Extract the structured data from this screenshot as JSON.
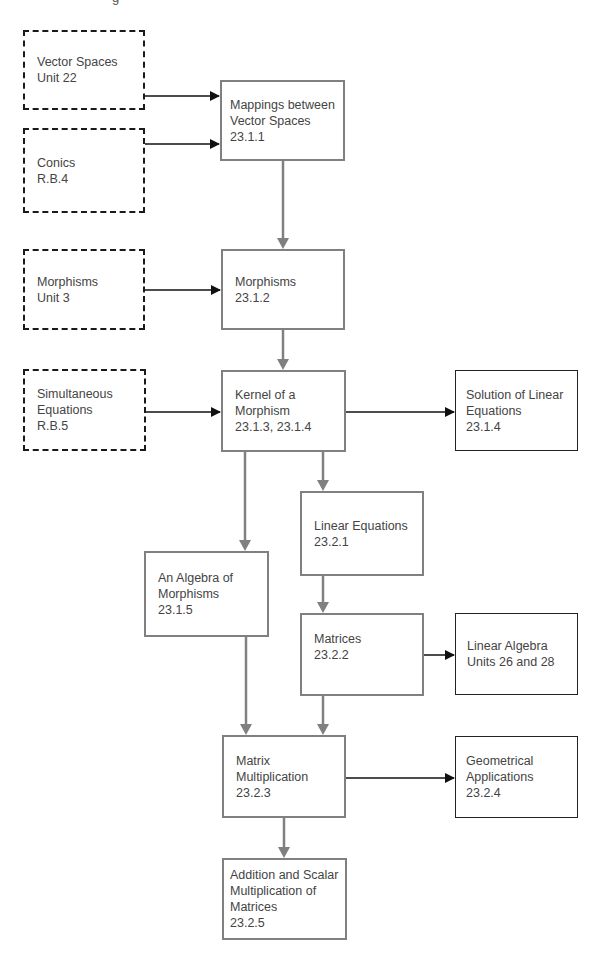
{
  "top_fragment": "g",
  "nodes": {
    "vector_spaces": {
      "lines": [
        "Vector Spaces",
        "Unit 22"
      ],
      "style": "dashed"
    },
    "conics": {
      "lines": [
        "Conics",
        "R.B.4"
      ],
      "style": "dashed"
    },
    "mappings": {
      "lines": [
        "Mappings between",
        "Vector Spaces",
        "23.1.1"
      ],
      "style": "gray"
    },
    "morphisms_unit3": {
      "lines": [
        "Morphisms",
        "Unit 3"
      ],
      "style": "dashed"
    },
    "morphisms": {
      "lines": [
        "Morphisms",
        "23.1.2"
      ],
      "style": "gray"
    },
    "simultaneous": {
      "lines": [
        "Simultaneous",
        "Equations",
        "R.B.5"
      ],
      "style": "dashed"
    },
    "kernel": {
      "lines": [
        "Kernel of a",
        "Morphism",
        "23.1.3, 23.1.4"
      ],
      "style": "gray"
    },
    "solution": {
      "lines": [
        "Solution of Linear",
        "Equations",
        "23.1.4"
      ],
      "style": "thin"
    },
    "linear_equations": {
      "lines": [
        "Linear Equations",
        "23.2.1"
      ],
      "style": "gray"
    },
    "algebra": {
      "lines": [
        "An Algebra of",
        "Morphisms",
        "23.1.5"
      ],
      "style": "gray"
    },
    "matrices": {
      "lines": [
        "Matrices",
        "23.2.2"
      ],
      "style": "gray"
    },
    "linear_algebra": {
      "lines": [
        "Linear Algebra",
        "Units 26 and 28"
      ],
      "style": "thin"
    },
    "matrix_mult": {
      "lines": [
        "Matrix",
        "Multiplication",
        "23.2.3"
      ],
      "style": "gray"
    },
    "geometrical": {
      "lines": [
        "Geometrical",
        "Applications",
        "23.2.4"
      ],
      "style": "thin"
    },
    "addition": {
      "lines": [
        "Addition and Scalar",
        "Multiplication of",
        "Matrices",
        "23.2.5"
      ],
      "style": "gray"
    }
  },
  "edges": [
    {
      "from": "vector_spaces",
      "to": "mappings",
      "kind": "black"
    },
    {
      "from": "conics",
      "to": "mappings",
      "kind": "black"
    },
    {
      "from": "mappings",
      "to": "morphisms",
      "kind": "gray"
    },
    {
      "from": "morphisms_unit3",
      "to": "morphisms",
      "kind": "black"
    },
    {
      "from": "morphisms",
      "to": "kernel",
      "kind": "gray"
    },
    {
      "from": "simultaneous",
      "to": "kernel",
      "kind": "black"
    },
    {
      "from": "kernel",
      "to": "solution",
      "kind": "black"
    },
    {
      "from": "kernel",
      "to": "linear_equations",
      "kind": "gray"
    },
    {
      "from": "kernel",
      "to": "algebra",
      "kind": "gray"
    },
    {
      "from": "linear_equations",
      "to": "matrices",
      "kind": "gray"
    },
    {
      "from": "matrices",
      "to": "linear_algebra",
      "kind": "black"
    },
    {
      "from": "algebra",
      "to": "matrix_mult",
      "kind": "gray"
    },
    {
      "from": "matrices",
      "to": "matrix_mult",
      "kind": "gray"
    },
    {
      "from": "matrix_mult",
      "to": "geometrical",
      "kind": "black"
    },
    {
      "from": "matrix_mult",
      "to": "addition",
      "kind": "gray"
    }
  ],
  "colors": {
    "prerequisite_border": "#1a1a1a",
    "core_border": "#808080",
    "further_border": "#222222",
    "text": "#444444"
  }
}
